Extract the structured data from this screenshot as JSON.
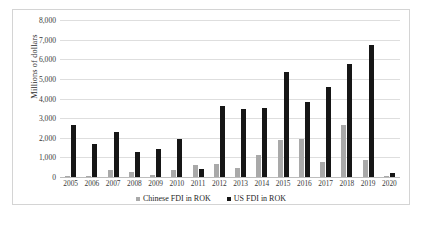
{
  "chart_data": {
    "type": "bar",
    "title": "",
    "xlabel": "",
    "ylabel": "Millions of dollars",
    "ylim": [
      0,
      8000
    ],
    "ytick_labels": [
      "8,000",
      "7,000",
      "6,000",
      "5,000",
      "4,000",
      "3,000",
      "2,000",
      "1,000",
      "0"
    ],
    "ytick_values": [
      8000,
      7000,
      6000,
      5000,
      4000,
      3000,
      2000,
      1000,
      0
    ],
    "grid": true,
    "legend_position": "bottom",
    "categories": [
      "2005",
      "2006",
      "2007",
      "2008",
      "2009",
      "2010",
      "2011",
      "2012",
      "2013",
      "2014",
      "2015",
      "2016",
      "2017",
      "2018",
      "2019",
      "2020"
    ],
    "series": [
      {
        "name": "Chinese FDI in ROK",
        "color": "#a9a9a9",
        "values": [
          30,
          40,
          380,
          280,
          120,
          350,
          600,
          680,
          450,
          1120,
          1900,
          1960,
          740,
          2630,
          880,
          30
        ]
      },
      {
        "name": "US FDI in ROK",
        "color": "#161616",
        "values": [
          2640,
          1670,
          2290,
          1270,
          1430,
          1920,
          400,
          3630,
          3450,
          3530,
          5350,
          3800,
          4600,
          5780,
          6750,
          230
        ]
      }
    ]
  }
}
